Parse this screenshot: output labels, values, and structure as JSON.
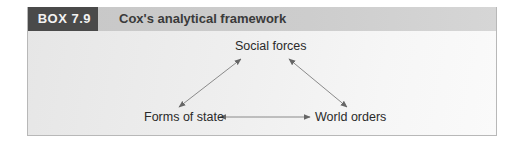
{
  "box": {
    "label": "BOX 7.9",
    "title": "Cox's analytical framework"
  },
  "diagram": {
    "nodes": [
      {
        "id": "social_forces",
        "label": "Social forces"
      },
      {
        "id": "forms_of_state",
        "label": "Forms of state"
      },
      {
        "id": "world_orders",
        "label": "World orders"
      }
    ],
    "edges": [
      {
        "from": "social_forces",
        "to": "forms_of_state",
        "type": "bidirectional"
      },
      {
        "from": "social_forces",
        "to": "world_orders",
        "type": "bidirectional"
      },
      {
        "from": "forms_of_state",
        "to": "world_orders",
        "type": "bidirectional"
      }
    ]
  },
  "colors": {
    "label_bg": "#4a4a4a",
    "header_bg": "#c8c8c8",
    "arrow": "#6a6a6a"
  }
}
